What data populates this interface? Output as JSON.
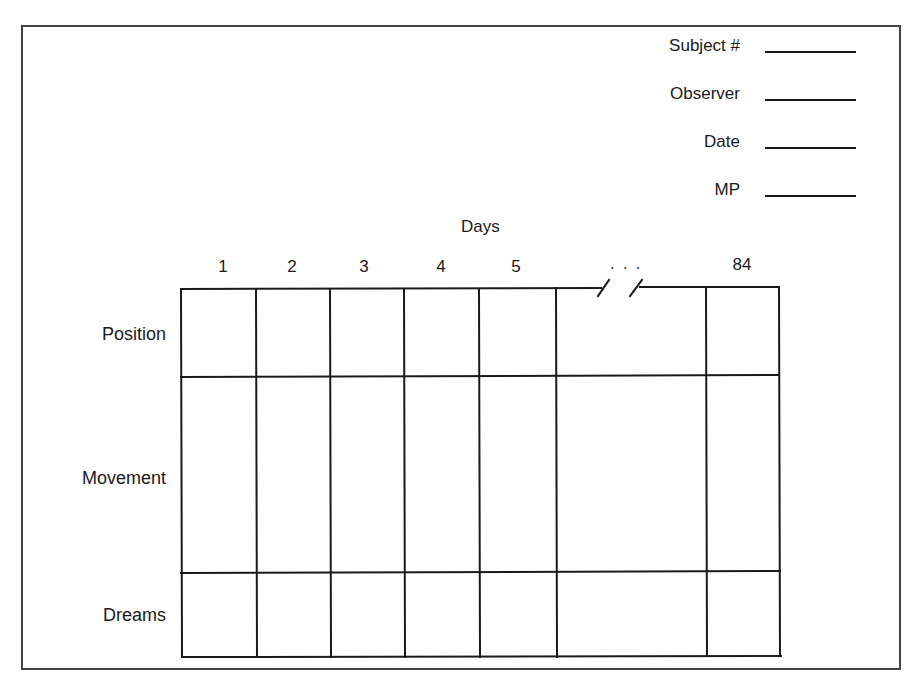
{
  "form": {
    "fields": [
      {
        "label": "Subject #",
        "value": ""
      },
      {
        "label": "Observer",
        "value": ""
      },
      {
        "label": "Date",
        "value": ""
      },
      {
        "label": "MP",
        "value": ""
      }
    ],
    "table": {
      "column_group_label": "Days",
      "columns": [
        "1",
        "2",
        "3",
        "4",
        "5",
        "...",
        "84"
      ],
      "ellipsis": ". . .",
      "rows": [
        "Position",
        "Movement",
        "Dreams"
      ]
    }
  },
  "colors": {
    "line": "#1a1a1a",
    "frame": "#444444",
    "background": "#ffffff"
  }
}
